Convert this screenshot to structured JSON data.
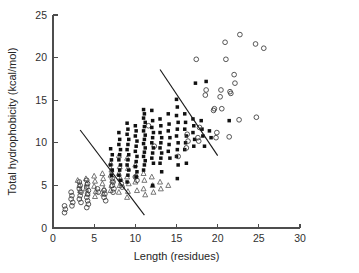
{
  "chart_data": {
    "type": "scatter",
    "title": "",
    "xlabel": "Length (residues)",
    "ylabel": "Total hydrophobicity (kcal/mol)",
    "xlim": [
      0,
      30
    ],
    "ylim": [
      0,
      25
    ],
    "xticks": [
      0,
      5,
      10,
      15,
      20,
      25,
      30
    ],
    "yticks": [
      0,
      5,
      10,
      15,
      20,
      25
    ],
    "xtick_labels": [
      "0",
      "5",
      "10",
      "15",
      "20",
      "25",
      "30"
    ],
    "ytick_labels": [
      "0",
      "5",
      "10",
      "15",
      "20",
      "25"
    ],
    "grid": false,
    "legend": "none",
    "series": [
      {
        "name": "open-triangle",
        "marker": "triangle-open",
        "points": [
          [
            3.0,
            5.6
          ],
          [
            3.2,
            5.0
          ],
          [
            3.3,
            4.4
          ],
          [
            4.0,
            5.8
          ],
          [
            4.1,
            5.2
          ],
          [
            4.0,
            4.6
          ],
          [
            4.2,
            4.0
          ],
          [
            5.0,
            6.1
          ],
          [
            5.1,
            5.5
          ],
          [
            5.0,
            4.9
          ],
          [
            5.2,
            4.3
          ],
          [
            5.1,
            3.7
          ],
          [
            6.0,
            6.4
          ],
          [
            6.1,
            5.8
          ],
          [
            6.0,
            5.2
          ],
          [
            6.2,
            4.6
          ],
          [
            6.1,
            4.0
          ],
          [
            7.0,
            7.6
          ],
          [
            7.1,
            6.8
          ],
          [
            7.0,
            6.2
          ],
          [
            7.2,
            5.6
          ],
          [
            7.1,
            5.0
          ],
          [
            7.0,
            4.4
          ],
          [
            8.0,
            8.5
          ],
          [
            8.1,
            7.2
          ],
          [
            8.0,
            6.4
          ],
          [
            8.2,
            5.8
          ],
          [
            8.1,
            5.0
          ],
          [
            8.0,
            4.2
          ],
          [
            9.0,
            8.2
          ],
          [
            9.1,
            7.0
          ],
          [
            9.0,
            6.0
          ],
          [
            9.2,
            5.2
          ],
          [
            9.1,
            4.3
          ],
          [
            9.0,
            3.6
          ],
          [
            10.0,
            7.4
          ],
          [
            10.1,
            6.2
          ],
          [
            10.0,
            5.4
          ],
          [
            10.2,
            4.4
          ],
          [
            11.0,
            6.4
          ],
          [
            11.1,
            5.6
          ],
          [
            11.0,
            4.6
          ],
          [
            11.2,
            3.9
          ],
          [
            12.0,
            6.0
          ],
          [
            12.1,
            5.0
          ],
          [
            12.2,
            4.2
          ],
          [
            13.0,
            5.4
          ],
          [
            13.1,
            4.6
          ],
          [
            14.0,
            5.0
          ]
        ]
      },
      {
        "name": "open-circle-low",
        "marker": "circle-open",
        "points": [
          [
            1.4,
            2.6
          ],
          [
            1.5,
            2.2
          ],
          [
            1.4,
            1.8
          ],
          [
            2.2,
            4.2
          ],
          [
            2.3,
            3.8
          ],
          [
            2.2,
            3.4
          ],
          [
            2.4,
            3.0
          ],
          [
            2.3,
            2.6
          ],
          [
            3.2,
            5.4
          ],
          [
            3.3,
            5.0
          ],
          [
            3.2,
            4.6
          ],
          [
            3.4,
            4.2
          ],
          [
            3.3,
            3.8
          ],
          [
            3.2,
            3.4
          ],
          [
            3.4,
            3.0
          ],
          [
            4.1,
            5.6
          ],
          [
            4.2,
            5.2
          ],
          [
            4.1,
            4.8
          ],
          [
            4.3,
            4.4
          ],
          [
            4.2,
            4.0
          ],
          [
            4.1,
            3.6
          ],
          [
            4.2,
            3.2
          ],
          [
            4.3,
            2.8
          ],
          [
            4.1,
            2.4
          ],
          [
            5.4,
            4.6
          ],
          [
            5.5,
            4.2
          ],
          [
            6.2,
            4.4
          ],
          [
            6.3,
            4.0
          ],
          [
            6.2,
            3.6
          ],
          [
            6.4,
            3.2
          ],
          [
            7.2,
            5.8
          ],
          [
            7.3,
            5.4
          ],
          [
            7.2,
            5.0
          ],
          [
            7.4,
            4.6
          ],
          [
            7.3,
            4.2
          ],
          [
            8.3,
            5.2
          ],
          [
            8.4,
            4.8
          ],
          [
            10.0,
            6.0
          ],
          [
            10.2,
            5.6
          ],
          [
            11.6,
            12.0
          ],
          [
            12.3,
            9.6
          ]
        ]
      },
      {
        "name": "filled-square",
        "marker": "square-filled",
        "points": [
          [
            7.0,
            9.3
          ],
          [
            7.2,
            8.6
          ],
          [
            7.1,
            8.0
          ],
          [
            7.0,
            7.4
          ],
          [
            7.2,
            6.8
          ],
          [
            7.1,
            6.2
          ],
          [
            8.0,
            11.2
          ],
          [
            8.1,
            10.4
          ],
          [
            8.0,
            9.8
          ],
          [
            8.2,
            9.2
          ],
          [
            8.1,
            8.6
          ],
          [
            8.0,
            8.0
          ],
          [
            8.2,
            7.4
          ],
          [
            8.1,
            6.8
          ],
          [
            8.0,
            6.2
          ],
          [
            8.2,
            5.6
          ],
          [
            9.0,
            12.3
          ],
          [
            9.1,
            11.6
          ],
          [
            9.0,
            11.0
          ],
          [
            9.2,
            10.4
          ],
          [
            9.1,
            9.8
          ],
          [
            9.0,
            9.2
          ],
          [
            9.2,
            8.6
          ],
          [
            9.1,
            8.0
          ],
          [
            9.0,
            7.4
          ],
          [
            9.2,
            6.8
          ],
          [
            9.1,
            6.2
          ],
          [
            9.0,
            5.4
          ],
          [
            10.0,
            12.0
          ],
          [
            10.1,
            11.4
          ],
          [
            10.0,
            10.8
          ],
          [
            10.2,
            10.2
          ],
          [
            10.1,
            9.6
          ],
          [
            10.0,
            9.0
          ],
          [
            10.2,
            8.4
          ],
          [
            10.1,
            7.8
          ],
          [
            10.0,
            7.2
          ],
          [
            10.2,
            6.6
          ],
          [
            10.1,
            6.0
          ],
          [
            11.0,
            13.9
          ],
          [
            11.1,
            13.4
          ],
          [
            11.0,
            12.9
          ],
          [
            11.2,
            12.4
          ],
          [
            11.1,
            11.9
          ],
          [
            11.0,
            11.4
          ],
          [
            11.2,
            10.9
          ],
          [
            11.1,
            10.4
          ],
          [
            11.0,
            9.9
          ],
          [
            11.2,
            9.4
          ],
          [
            11.1,
            8.9
          ],
          [
            11.0,
            8.4
          ],
          [
            11.2,
            7.9
          ],
          [
            11.1,
            7.4
          ],
          [
            11.0,
            6.8
          ],
          [
            12.0,
            13.8
          ],
          [
            12.1,
            12.6
          ],
          [
            12.0,
            11.8
          ],
          [
            12.2,
            11.2
          ],
          [
            12.1,
            10.6
          ],
          [
            12.0,
            10.0
          ],
          [
            12.2,
            9.4
          ],
          [
            12.1,
            8.8
          ],
          [
            12.0,
            8.2
          ],
          [
            12.2,
            7.6
          ],
          [
            12.1,
            5.0
          ],
          [
            13.0,
            12.8
          ],
          [
            13.1,
            12.0
          ],
          [
            13.0,
            11.2
          ],
          [
            13.2,
            10.6
          ],
          [
            13.1,
            10.0
          ],
          [
            13.0,
            9.4
          ],
          [
            13.2,
            8.8
          ],
          [
            13.1,
            8.2
          ],
          [
            13.0,
            7.6
          ],
          [
            13.2,
            6.6
          ],
          [
            14.0,
            13.4
          ],
          [
            14.1,
            12.2
          ],
          [
            14.0,
            11.4
          ],
          [
            14.2,
            10.6
          ],
          [
            14.1,
            9.8
          ],
          [
            14.0,
            9.0
          ],
          [
            14.2,
            8.2
          ],
          [
            15.0,
            15.1
          ],
          [
            15.1,
            14.2
          ],
          [
            15.0,
            13.2
          ],
          [
            15.2,
            12.4
          ],
          [
            15.1,
            11.6
          ],
          [
            15.0,
            10.8
          ],
          [
            15.2,
            10.0
          ],
          [
            15.1,
            9.2
          ],
          [
            15.0,
            8.4
          ],
          [
            15.2,
            7.4
          ],
          [
            15.1,
            5.8
          ],
          [
            16.0,
            13.4
          ],
          [
            16.1,
            12.4
          ],
          [
            16.0,
            11.6
          ],
          [
            16.2,
            10.8
          ],
          [
            16.1,
            10.0
          ],
          [
            16.0,
            9.2
          ],
          [
            16.2,
            7.6
          ],
          [
            17.0,
            12.8
          ],
          [
            17.1,
            12.0
          ],
          [
            17.0,
            11.2
          ],
          [
            17.2,
            10.4
          ],
          [
            17.1,
            9.6
          ],
          [
            17.3,
            17.0
          ],
          [
            18.0,
            12.6
          ],
          [
            18.1,
            11.6
          ],
          [
            18.2,
            10.8
          ],
          [
            18.6,
            17.2
          ],
          [
            18.4,
            9.6
          ],
          [
            19.0,
            11.4
          ],
          [
            19.2,
            10.6
          ],
          [
            21.4,
            12.6
          ]
        ]
      },
      {
        "name": "open-circle-high",
        "marker": "circle-open",
        "points": [
          [
            17.4,
            19.8
          ],
          [
            18.6,
            16.2
          ],
          [
            18.5,
            15.6
          ],
          [
            19.6,
            14.0
          ],
          [
            19.5,
            13.8
          ],
          [
            20.4,
            16.2
          ],
          [
            20.3,
            15.4
          ],
          [
            20.5,
            14.0
          ],
          [
            21.0,
            19.8
          ],
          [
            20.9,
            21.8
          ],
          [
            21.5,
            16.0
          ],
          [
            21.6,
            15.8
          ],
          [
            21.4,
            10.7
          ],
          [
            22.0,
            18.0
          ],
          [
            22.1,
            17.0
          ],
          [
            22.7,
            22.7
          ],
          [
            24.6,
            21.6
          ],
          [
            25.6,
            21.1
          ],
          [
            22.6,
            12.7
          ],
          [
            24.7,
            13.0
          ],
          [
            19.8,
            10.6
          ],
          [
            19.9,
            11.2
          ],
          [
            17.8,
            11.8
          ],
          [
            17.6,
            10.6
          ],
          [
            17.7,
            10.2
          ],
          [
            16.3,
            11.0
          ],
          [
            16.4,
            10.2
          ],
          [
            16.2,
            9.4
          ],
          [
            15.2,
            8.4
          ]
        ]
      }
    ],
    "trend_lines": [
      {
        "name": "left-trend",
        "x1": 3.3,
        "y1": 11.5,
        "x2": 11.1,
        "y2": 1.5
      },
      {
        "name": "right-trend",
        "x1": 13.0,
        "y1": 18.6,
        "x2": 20.0,
        "y2": 8.5
      }
    ]
  }
}
